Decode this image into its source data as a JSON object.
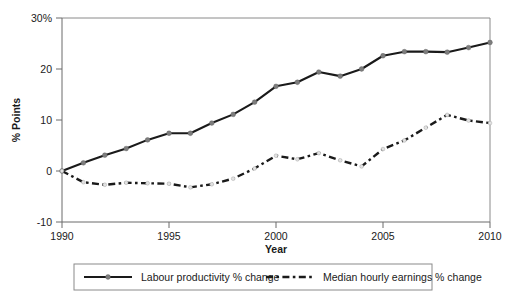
{
  "chart_data": {
    "type": "line",
    "title": "",
    "xlabel": "Year",
    "ylabel": "% Points",
    "xlim": [
      1990,
      2010
    ],
    "ylim": [
      -10,
      30
    ],
    "grid": false,
    "legend_position": "bottom",
    "x_ticks": [
      "1990",
      "1995",
      "2000",
      "2005",
      "2010"
    ],
    "x_tick_values": [
      1990,
      1995,
      2000,
      2005,
      2010
    ],
    "y_ticks": [
      "-10",
      "0",
      "10",
      "20",
      "30%"
    ],
    "y_tick_values": [
      -10,
      0,
      10,
      20,
      30
    ],
    "x": [
      1990,
      1991,
      1992,
      1993,
      1994,
      1995,
      1996,
      1997,
      1998,
      1999,
      2000,
      2001,
      2002,
      2003,
      2004,
      2005,
      2006,
      2007,
      2008,
      2009,
      2010
    ],
    "series": [
      {
        "name": "Labour productivity % change",
        "style": "solid",
        "marker": "circle",
        "color": "#1a1a1a",
        "values": [
          0,
          1.6,
          3.1,
          4.4,
          6.1,
          7.4,
          7.4,
          9.4,
          11.1,
          13.5,
          16.6,
          17.4,
          19.4,
          18.6,
          20.0,
          22.6,
          23.4,
          23.4,
          23.3,
          24.2,
          25.2
        ]
      },
      {
        "name": "Median hourly earnings % change",
        "style": "dash-dot",
        "marker": "circle",
        "color": "#1a1a1a",
        "values": [
          0,
          -2.2,
          -2.7,
          -2.3,
          -2.4,
          -2.5,
          -3.2,
          -2.6,
          -1.5,
          0.5,
          3.0,
          2.3,
          3.5,
          2.1,
          0.9,
          4.3,
          6.0,
          8.5,
          11.0,
          9.9,
          9.4
        ]
      }
    ]
  },
  "legend": {
    "items": [
      {
        "label": "Labour productivity % change",
        "style": "solid"
      },
      {
        "label": "Median hourly earnings % change",
        "style": "dash-dot"
      }
    ]
  }
}
